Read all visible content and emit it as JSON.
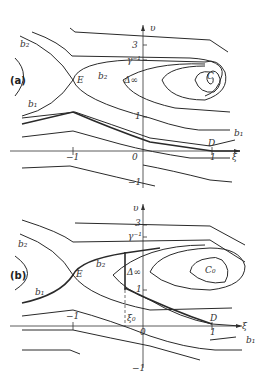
{
  "panels": [
    {
      "id": "a",
      "tag": "(a)",
      "labels": {
        "v_axis": "υ",
        "xi_axis": "ξ",
        "tick_3": "3",
        "tick_1_upper": "1",
        "tick_gamma": "γ⁻¹",
        "tick_0": "0",
        "tick_neg1_x": "−1",
        "tick_1_x": "1",
        "tick_neg1_y": "−1",
        "point_E": "E",
        "point_D": "D",
        "point_C": "C",
        "delta_inf": "Δ∞",
        "branch_b2_left": "b₂",
        "branch_b2_mid": "b₂",
        "branch_b1_left": "b₁",
        "branch_b1_right": "b₁"
      }
    },
    {
      "id": "b",
      "tag": "(b)",
      "labels": {
        "v_axis": "υ",
        "xi_axis": "ξ",
        "tick_3": "3",
        "tick_1_upper": "1",
        "tick_gamma": "γ⁻¹",
        "tick_0": "0",
        "tick_neg1_x": "−1",
        "tick_1_x": "1",
        "tick_neg1_y": "−1",
        "point_E": "E",
        "point_D": "D",
        "point_C0": "C₀",
        "delta_inf": "Δ∞",
        "xi0": "ξ₀",
        "branch_b2_left": "b₂",
        "branch_b2_mid": "b₂",
        "branch_b1_left": "b₁",
        "branch_b1_right": "b₁"
      }
    }
  ]
}
